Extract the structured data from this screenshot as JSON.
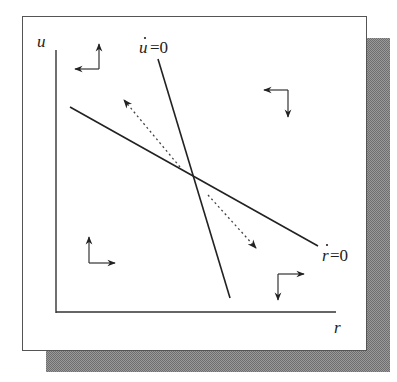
{
  "diagram": {
    "type": "phase-diagram",
    "axes": {
      "y_label": "u",
      "x_label": "r"
    },
    "isoclines": [
      {
        "id": "u-dot-zero",
        "var": "u",
        "eq": "=0",
        "label": "u̇=0"
      },
      {
        "id": "r-dot-zero",
        "var": "r",
        "eq": "=0",
        "label": "ṙ=0"
      }
    ],
    "direction_arrows": [
      {
        "region": "top-left",
        "horizontal": "left",
        "vertical": "up"
      },
      {
        "region": "top-right",
        "horizontal": "left",
        "vertical": "down"
      },
      {
        "region": "bottom-left",
        "horizontal": "right",
        "vertical": "up"
      },
      {
        "region": "bottom-right",
        "horizontal": "right",
        "vertical": "down"
      }
    ],
    "saddle_paths": [
      {
        "direction": "away-from-equilibrium-up-left",
        "style": "dotted"
      },
      {
        "direction": "away-from-equilibrium-down-right",
        "style": "dotted"
      }
    ],
    "colors": {
      "line": "#222222",
      "frame": "#555555",
      "shadow": "#8a8a8a",
      "background": "#ffffff"
    }
  }
}
